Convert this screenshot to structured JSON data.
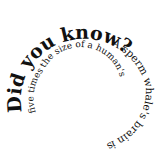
{
  "spiral_text": {
    "heading": "Did you know?",
    "body": " A sperm whale's brain is five times the size of a human's",
    "full": "Did you know? A sperm whale's brain is five times the size of a human's"
  },
  "colors": {
    "text": "#111111",
    "background": "#ffffff"
  }
}
